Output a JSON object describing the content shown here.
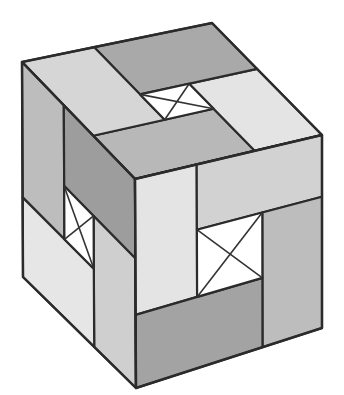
{
  "figure": {
    "width": 344,
    "height": 395
  },
  "colors": {
    "outline": "#2b2b2b",
    "window": "#ffffff",
    "cross": "#333333"
  },
  "faces": [
    {
      "name": "top-face",
      "corners": {
        "o": [
          135,
          179
        ],
        "u": [
          22,
          62
        ],
        "v": [
          322,
          135
        ],
        "uv": [
          212,
          23
        ]
      },
      "window": {
        "u": [
          0.37,
          0.59
        ],
        "v": [
          0.38,
          0.64
        ]
      },
      "pieces": [
        {
          "name": "top-front-bar",
          "u": [
            0,
            0.37
          ],
          "v": [
            0,
            0.64
          ],
          "color": "#b8b8b8"
        },
        {
          "name": "top-right-bar",
          "u": [
            0,
            0.59
          ],
          "v": [
            0.64,
            1
          ],
          "color": "#e4e4e4"
        },
        {
          "name": "top-back-bar",
          "u": [
            0.59,
            1
          ],
          "v": [
            0.38,
            1
          ],
          "color": "#a9a9a9"
        },
        {
          "name": "top-left-bar",
          "u": [
            0.37,
            1
          ],
          "v": [
            0,
            0.38
          ],
          "color": "#d6d6d6"
        }
      ]
    },
    {
      "name": "left-face",
      "corners": {
        "o": [
          22,
          62
        ],
        "u": [
          135,
          179
        ],
        "v": [
          23,
          277
        ],
        "uv": [
          136,
          388
        ]
      },
      "window": {
        "u": [
          0.37,
          0.63
        ],
        "v": [
          0.38,
          0.63
        ]
      },
      "pieces": [
        {
          "name": "left-outer-bar",
          "u": [
            0,
            0.37
          ],
          "v": [
            0,
            0.63
          ],
          "color": "#bdbdbd"
        },
        {
          "name": "left-top-bar",
          "u": [
            0.37,
            1
          ],
          "v": [
            0,
            0.38
          ],
          "color": "#9d9d9d"
        },
        {
          "name": "left-inner-bar",
          "u": [
            0.63,
            1
          ],
          "v": [
            0.38,
            1
          ],
          "color": "#cfcfcf"
        },
        {
          "name": "left-bottom-bar",
          "u": [
            0,
            0.63
          ],
          "v": [
            0.63,
            1
          ],
          "color": "#e6e6e6"
        }
      ]
    },
    {
      "name": "right-face",
      "corners": {
        "o": [
          135,
          179
        ],
        "u": [
          322,
          135
        ],
        "v": [
          136,
          388
        ],
        "uv": [
          322,
          328
        ]
      },
      "window": {
        "u": [
          0.33,
          0.68
        ],
        "v": [
          0.32,
          0.65
        ]
      },
      "pieces": [
        {
          "name": "right-front-bar",
          "u": [
            0,
            0.33
          ],
          "v": [
            0,
            0.65
          ],
          "color": "#e4e4e4"
        },
        {
          "name": "right-top-bar",
          "u": [
            0.33,
            1
          ],
          "v": [
            0,
            0.32
          ],
          "color": "#d2d2d2"
        },
        {
          "name": "right-outer-bar",
          "u": [
            0.68,
            1
          ],
          "v": [
            0.32,
            1
          ],
          "color": "#bdbdbd"
        },
        {
          "name": "right-bottom-bar",
          "u": [
            0,
            0.68
          ],
          "v": [
            0.65,
            1
          ],
          "color": "#a3a3a3"
        }
      ]
    }
  ]
}
